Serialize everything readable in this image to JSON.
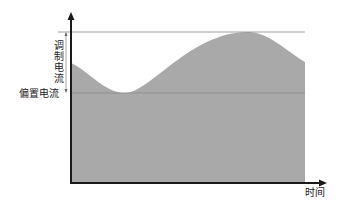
{
  "diagram": {
    "type": "waveform",
    "labels": {
      "modulation_current": "调制电流",
      "bias_current": "偏置电流",
      "x_axis": "时间"
    },
    "colors": {
      "fill": "#a9a9a9",
      "axis": "#1a1a1a",
      "reference_line": "#888888"
    },
    "geometry": {
      "origin": [
        71,
        183
      ],
      "y_axis_top": 14,
      "x_axis_right": 326,
      "peak_level_y": 32,
      "bias_level_y": 93,
      "curve_end_x": 305
    }
  }
}
